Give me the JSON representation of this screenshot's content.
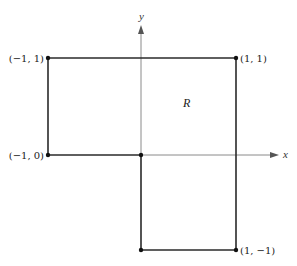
{
  "diagram": {
    "region_label": "R",
    "axes": {
      "x_label": "x",
      "y_label": "y"
    },
    "points": [
      {
        "label": "(−1, 1)",
        "x": -1,
        "y": 1
      },
      {
        "label": "(1, 1)",
        "x": 1,
        "y": 1
      },
      {
        "label": "(−1, 0)",
        "x": -1,
        "y": 0
      },
      {
        "label": "(1, −1)",
        "x": 1,
        "y": -1
      }
    ],
    "origin_point": {
      "x": 0,
      "y": 0
    },
    "boundary_vertices": [
      [
        -1,
        1
      ],
      [
        1,
        1
      ],
      [
        1,
        -1
      ],
      [
        0,
        -1
      ],
      [
        0,
        0
      ],
      [
        -1,
        0
      ]
    ],
    "colors": {
      "boundary": "#2b2b2b",
      "axis": "#888888",
      "background": "#ffffff"
    }
  }
}
